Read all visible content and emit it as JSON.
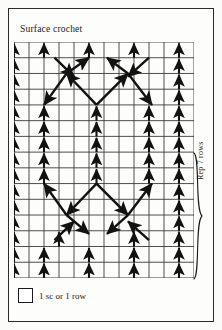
{
  "page": {
    "title": "Surface crochet",
    "background_color": "#fdfdfb",
    "ink_color": "#1a1a1a"
  },
  "legend": {
    "swatch_icon": "square-outline-icon",
    "text": "1 sc or 1 row"
  },
  "repeat": {
    "label": "Rep 7 rows",
    "bracket_icon": "curly-brace-icon",
    "rows": 7
  },
  "chart_data": {
    "type": "diagram",
    "title": "Surface crochet",
    "grid": {
      "columns": 12,
      "rows": 15,
      "cell_width": 15,
      "cell_height": 15.73,
      "grid_on": true,
      "stroke": "#2a2a2a"
    },
    "symbols": {
      "vertical_arrow": "1 sc or 1 row worked vertically",
      "diagonal_arrow": "surface crochet worked on the diagonal"
    },
    "vertical_columns": [
      0,
      2,
      5,
      8,
      11
    ],
    "legend_entries": [
      {
        "symbol": "square-outline-icon",
        "label": "1 sc or 1 row"
      }
    ],
    "annotations": [
      {
        "text": "Surface crochet",
        "position": "top-left"
      },
      {
        "text": "Rep 7 rows",
        "position": "right",
        "rotated": true
      }
    ],
    "vertical_runs": [
      {
        "col": 0,
        "row_start": 0,
        "row_end": 15
      },
      {
        "col": 11,
        "row_start": 0,
        "row_end": 15
      },
      {
        "col": 2,
        "row_start": 0,
        "row_end": 1
      },
      {
        "col": 5,
        "row_start": 0,
        "row_end": 1
      },
      {
        "col": 8,
        "row_start": 0,
        "row_end": 1
      },
      {
        "col": 2,
        "row_start": 4,
        "row_end": 9
      },
      {
        "col": 9,
        "row_start": 4,
        "row_end": 9
      },
      {
        "col": 5.5,
        "row_start": 4,
        "row_end": 9
      },
      {
        "col": 2,
        "row_start": 13,
        "row_end": 15
      },
      {
        "col": 5,
        "row_start": 13,
        "row_end": 15
      },
      {
        "col": 8,
        "row_start": 13,
        "row_end": 15
      },
      {
        "col": 3,
        "row_start": 12,
        "row_end": 13
      },
      {
        "col": 8,
        "row_start": 12,
        "row_end": 13
      }
    ],
    "diagonals": [
      {
        "x1": 5.5,
        "y1": 4,
        "x2": 3.5,
        "y2": 2,
        "dir": "up-left"
      },
      {
        "x1": 5.5,
        "y1": 4,
        "x2": 7.6,
        "y2": 2,
        "dir": "up-right"
      },
      {
        "x1": 3.5,
        "y1": 2,
        "x2": 2.0,
        "y2": 4,
        "dir": "down-left"
      },
      {
        "x1": 7.6,
        "y1": 2,
        "x2": 9.2,
        "y2": 4,
        "dir": "down-right"
      },
      {
        "x1": 3.5,
        "y1": 2,
        "x2": 5.0,
        "y2": 1,
        "dir": "up-right"
      },
      {
        "x1": 7.6,
        "y1": 2,
        "x2": 6.2,
        "y2": 1,
        "dir": "up-left"
      },
      {
        "x1": 2.7,
        "y1": 1,
        "x2": 4.0,
        "y2": 2.2,
        "dir": "down-right"
      },
      {
        "x1": 9.0,
        "y1": 1,
        "x2": 7.6,
        "y2": 2.2,
        "dir": "down-left"
      },
      {
        "x1": 5.5,
        "y1": 9,
        "x2": 3.5,
        "y2": 11,
        "dir": "down-left"
      },
      {
        "x1": 5.5,
        "y1": 9,
        "x2": 7.6,
        "y2": 11,
        "dir": "down-right"
      },
      {
        "x1": 3.5,
        "y1": 11,
        "x2": 2.0,
        "y2": 9,
        "dir": "up-left"
      },
      {
        "x1": 7.6,
        "y1": 11,
        "x2": 9.2,
        "y2": 9,
        "dir": "up-right"
      },
      {
        "x1": 3.5,
        "y1": 11,
        "x2": 5.0,
        "y2": 12.2,
        "dir": "down-right"
      },
      {
        "x1": 7.6,
        "y1": 11,
        "x2": 6.2,
        "y2": 12.2,
        "dir": "down-left"
      },
      {
        "x1": 2.7,
        "y1": 12.6,
        "x2": 4.0,
        "y2": 11.4,
        "dir": "up-right"
      },
      {
        "x1": 9.0,
        "y1": 12.6,
        "x2": 7.6,
        "y2": 11.4,
        "dir": "up-left"
      }
    ]
  }
}
